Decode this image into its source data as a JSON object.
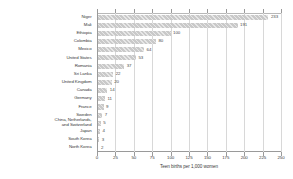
{
  "chart_data": {
    "type": "bar",
    "orientation": "horizontal",
    "title": "",
    "xlabel": "Teen births per 1,000 women",
    "ylabel": "",
    "xlim": [
      0,
      250
    ],
    "xticks": [
      0,
      25,
      50,
      75,
      100,
      125,
      150,
      175,
      200,
      225,
      250
    ],
    "grid": true,
    "legend": false,
    "categories": [
      "Niger",
      "Mali",
      "Ethiopia",
      "Colombia",
      "Mexico",
      "United States",
      "Romania",
      "Sri Lanka",
      "United Kingdom",
      "Canada",
      "Germany",
      "France",
      "Sweden",
      "China, Netherlands,\nand Switzerland",
      "Japan",
      "South Korea",
      "North Korea"
    ],
    "values": [
      233,
      191,
      100,
      80,
      64,
      53,
      37,
      22,
      20,
      14,
      11,
      9,
      7,
      5,
      4,
      3,
      2
    ],
    "value_labels": [
      "233",
      "191",
      "100",
      "80",
      "64",
      "53",
      "37",
      "22",
      "20",
      "14",
      "11",
      "9",
      "7",
      "5",
      "4",
      "3",
      "2"
    ],
    "bar_color": "#c9c9c9",
    "grid_color": "#d8d8d8",
    "axis_color": "#9a9a9a",
    "text_color": "#3a3a3a"
  }
}
